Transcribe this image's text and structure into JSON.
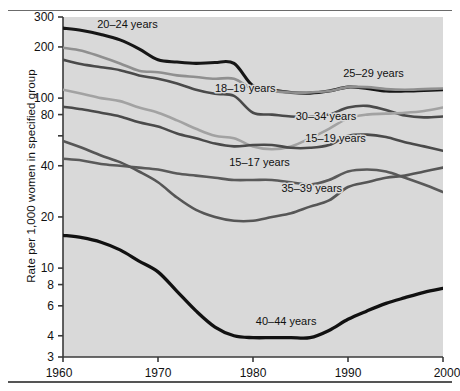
{
  "figure": {
    "ylabel": "Rate per 1,000 women in specified group",
    "plot_bg": "#d9d9d9",
    "axis_color": "#3a3a3a"
  },
  "axis": {
    "y_ticks_labeled": [
      "300",
      "200",
      "100",
      "80",
      "40",
      "20",
      "10",
      "8",
      "6",
      "4",
      "3"
    ],
    "y_tick_unlabeled": [
      60
    ],
    "x_ticks": [
      "1960",
      "1970",
      "1980",
      "1990",
      "2000"
    ]
  },
  "chart_data": {
    "type": "line",
    "title": "",
    "subtitle": "",
    "xlabel": "",
    "ylabel": "Rate per 1,000 women in specified group",
    "yscale": "log",
    "ylim": [
      3,
      300
    ],
    "xlim": [
      1960,
      2000
    ],
    "grid": false,
    "legend": "inline-labels",
    "y_tick_values": [
      300,
      200,
      100,
      80,
      60,
      40,
      20,
      10,
      8,
      6,
      4,
      3
    ],
    "y_tick_labels": [
      "300",
      "200",
      "100",
      "80",
      "",
      "40",
      "20",
      "10",
      "8",
      "6",
      "4",
      "3"
    ],
    "x_tick_values": [
      1960,
      1970,
      1980,
      1990,
      2000
    ],
    "x": [
      1960,
      1962,
      1964,
      1966,
      1968,
      1970,
      1972,
      1974,
      1976,
      1978,
      1980,
      1982,
      1984,
      1986,
      1988,
      1990,
      1992,
      1994,
      1996,
      1998,
      2000
    ],
    "series": [
      {
        "name": "20–24 years",
        "label": "20–24 years",
        "color": "#161616",
        "width": 3.1,
        "label_xy": [
          1963.6,
          258
        ],
        "values": [
          258,
          250,
          237,
          220,
          195,
          168,
          163,
          160,
          162,
          160,
          118,
          112,
          108,
          107,
          110,
          116,
          114,
          110,
          110,
          111,
          112
        ]
      },
      {
        "name": "25–29 years",
        "label": "25–29 years",
        "color": "#8f8f8f",
        "width": 2.6,
        "label_xy": [
          1989.5,
          133
        ],
        "values": [
          198,
          190,
          175,
          160,
          145,
          142,
          136,
          133,
          130,
          130,
          113,
          110,
          108,
          108,
          110,
          116,
          116,
          113,
          112,
          113,
          114
        ]
      },
      {
        "name": "18–19 years",
        "label": "18–19 years",
        "color": "#4a4a4a",
        "width": 2.6,
        "label_xy": [
          1976.0,
          108
        ],
        "values": [
          168,
          158,
          152,
          146,
          136,
          130,
          122,
          112,
          106,
          103,
          82,
          80,
          78,
          78,
          80,
          88,
          90,
          85,
          79,
          77,
          78
        ]
      },
      {
        "name": "30–34 years",
        "label": "30–34 years",
        "color": "#a2a2a2",
        "width": 2.6,
        "label_xy": [
          1984.5,
          74
        ],
        "values": [
          112,
          106,
          100,
          96,
          88,
          82,
          74,
          66,
          60,
          58,
          52,
          50,
          52,
          58,
          66,
          76,
          80,
          81,
          82,
          84,
          88
        ]
      },
      {
        "name": "15–19 years",
        "label": "15–19 years",
        "color": "#4a4a4a",
        "width": 2.6,
        "label_xy": [
          1985.5,
          55
        ],
        "values": [
          89,
          86,
          82,
          78,
          72,
          68,
          62,
          58,
          54,
          52,
          53,
          53,
          51,
          51,
          53,
          60,
          61,
          59,
          55,
          52,
          49
        ]
      },
      {
        "name": "15–17 years",
        "label": "15–17 years",
        "color": "#5a5a5a",
        "width": 2.6,
        "label_xy": [
          1977.5,
          40
        ],
        "values": [
          44,
          43,
          41,
          40,
          39,
          38,
          36,
          35,
          34,
          33,
          33,
          33,
          32,
          31,
          33,
          37,
          38,
          37,
          34,
          31,
          28
        ]
      },
      {
        "name": "35–39 years",
        "label": "35–39 years",
        "color": "#565656",
        "width": 2.6,
        "label_xy": [
          1983.0,
          28
        ],
        "values": [
          56,
          51,
          46,
          42,
          37,
          32,
          26,
          22,
          20,
          19,
          19,
          20,
          21,
          23,
          25,
          30,
          32,
          34,
          35,
          37,
          39
        ]
      },
      {
        "name": "40–44 years",
        "label": "40–44 years",
        "color": "#111111",
        "width": 3.3,
        "label_xy": [
          1980.3,
          4.6
        ],
        "values": [
          15.6,
          15.1,
          14.2,
          12.8,
          11.0,
          9.5,
          7.3,
          5.6,
          4.5,
          4.0,
          3.9,
          3.9,
          3.9,
          3.9,
          4.3,
          5.0,
          5.6,
          6.2,
          6.7,
          7.2,
          7.6
        ]
      }
    ]
  }
}
